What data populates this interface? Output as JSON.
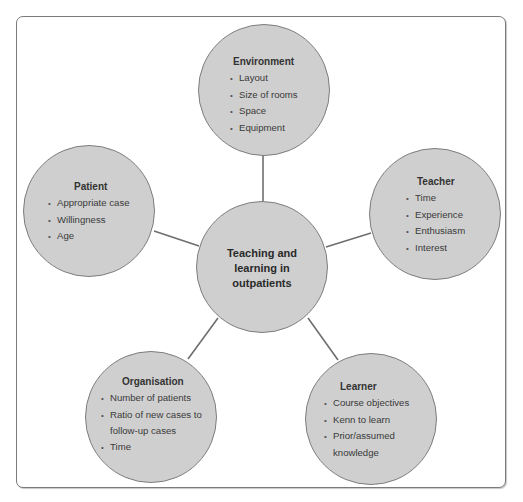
{
  "diagram": {
    "type": "hub-and-spoke",
    "center": {
      "lines": [
        "Teaching and",
        "learning in",
        "outpatients"
      ]
    },
    "nodes": {
      "environment": {
        "title": "Environment",
        "items": [
          "Layout",
          "Size of rooms",
          "Space",
          "Equipment"
        ]
      },
      "patient": {
        "title": "Patient",
        "items": [
          "Appropriate case",
          "Willingness",
          "Age"
        ]
      },
      "teacher": {
        "title": "Teacher",
        "items": [
          "Time",
          "Experience",
          "Enthusiasm",
          "Interest"
        ]
      },
      "organisation": {
        "title": "Organisation",
        "items": [
          "Number of patients",
          "Ratio of new cases to",
          "follow-up cases",
          "Time"
        ]
      },
      "learner": {
        "title": "Learner",
        "items": [
          "Course objectives",
          "Kenn to learn",
          "Prior/assumed",
          "knowledge"
        ]
      }
    },
    "bullet": "•",
    "colors": {
      "circle_fill": "#cfcfcf",
      "circle_stroke": "#7d7d7d",
      "connector": "#6e6e6e",
      "frame_border": "#7a7a7a",
      "text": "#333333"
    }
  }
}
